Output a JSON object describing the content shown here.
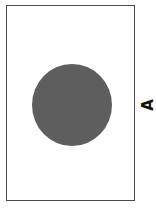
{
  "diagram": {
    "shapes": [
      {
        "type": "rectangle",
        "stroke": "#4a4a4a",
        "fill": "#ffffff"
      },
      {
        "type": "circle",
        "fill": "#5e5e5e"
      }
    ],
    "label": "A"
  }
}
